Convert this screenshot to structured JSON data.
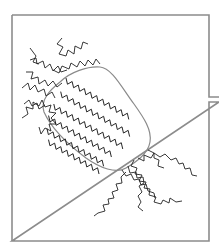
{
  "figure": {
    "colors": {
      "frame": "#8c8c8c",
      "capsule_outline": "#8a8a8a",
      "chains": "#222222",
      "background": "#ffffff"
    },
    "frame": {
      "x": 12,
      "y": 15,
      "width": 197,
      "height": 226,
      "connector_gap_y": [
        97,
        102
      ]
    },
    "capsule": {
      "from": [
        50,
        78
      ],
      "to": [
        148,
        160
      ],
      "aligned_chain_count": 6
    },
    "loose_chain_ends": {
      "top_left": 7,
      "bottom_right": 6
    }
  }
}
